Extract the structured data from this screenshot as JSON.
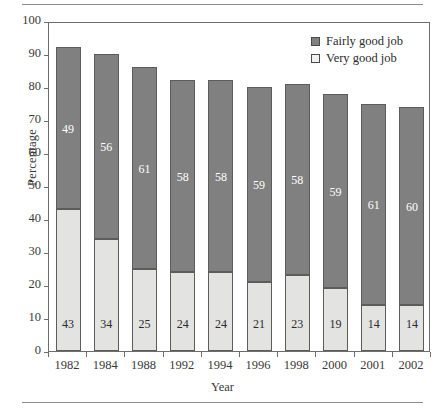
{
  "chart_data": {
    "type": "bar",
    "subtype": "stacked-vertical",
    "title": "",
    "xlabel": "Year",
    "ylabel": "Percentage",
    "ylim": [
      0,
      100
    ],
    "ytick_step": 10,
    "yticks": [
      "0",
      "10",
      "20",
      "30",
      "40",
      "50",
      "60",
      "70",
      "80",
      "90",
      "100"
    ],
    "grid": false,
    "legend_position": "top-right",
    "categories": [
      "1982",
      "1984",
      "1988",
      "1992",
      "1994",
      "1996",
      "1998",
      "2000",
      "2001",
      "2002"
    ],
    "series": [
      {
        "name": "Very good job",
        "color": "#e3e3e1",
        "values": [
          43,
          34,
          25,
          24,
          24,
          21,
          23,
          19,
          14,
          14
        ]
      },
      {
        "name": "Fairly good job",
        "color": "#808080",
        "values": [
          49,
          56,
          61,
          58,
          58,
          59,
          58,
          59,
          61,
          60
        ]
      }
    ],
    "totals": [
      92,
      90,
      86,
      82,
      82,
      80,
      81,
      78,
      75,
      74
    ]
  },
  "legend": {
    "items": [
      {
        "label": "Fairly good job",
        "swatch": "dark"
      },
      {
        "label": "Very good job",
        "swatch": "light"
      }
    ]
  }
}
